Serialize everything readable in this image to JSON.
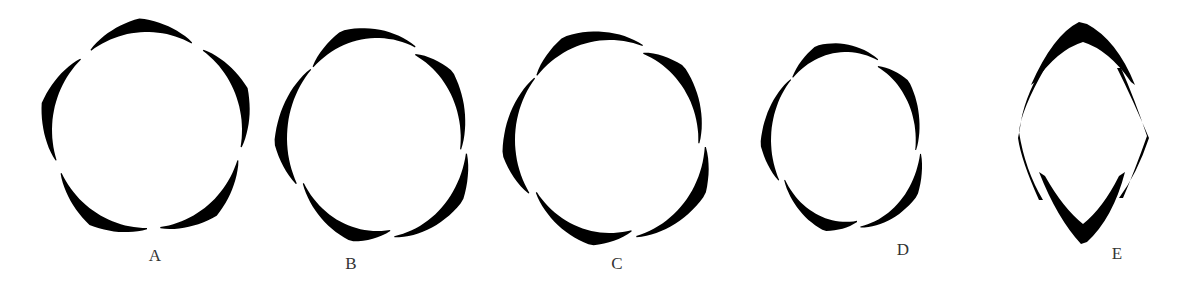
{
  "figures": [
    {
      "id": "A",
      "label": "A",
      "cx": 147,
      "cy": 130,
      "rx": 95,
      "ry": 98,
      "segments": 5,
      "start": -126,
      "span": 64,
      "twist": 0,
      "overlap": false,
      "label_x": 155,
      "label_y": 246
    },
    {
      "id": "B",
      "label": "B",
      "cx": 377,
      "cy": 138,
      "rx": 90,
      "ry": 100,
      "segments": 5,
      "start": -135,
      "span": 70,
      "twist": 8,
      "overlap": true,
      "label_x": 351,
      "label_y": 254
    },
    {
      "id": "C",
      "label": "C",
      "cx": 610,
      "cy": 140,
      "rx": 95,
      "ry": 100,
      "segments": 5,
      "start": -140,
      "span": 70,
      "twist": 6,
      "overlap": true,
      "label_x": 617,
      "label_y": 254
    },
    {
      "id": "D",
      "label": "D",
      "cx": 846,
      "cy": 140,
      "rx": 75,
      "ry": 88,
      "segments": 5,
      "start": -135,
      "span": 70,
      "twist": 12,
      "overlap": true,
      "label_x": 903,
      "label_y": 240
    },
    {
      "id": "E",
      "label": "E",
      "cx": 1083,
      "cy": 130,
      "rx": 58,
      "ry": 118,
      "segments": 4,
      "shape": "lens",
      "label_x": 1117,
      "label_y": 244
    }
  ],
  "colors": {
    "ink": "#000000",
    "label": "#333333",
    "background": "#ffffff"
  }
}
